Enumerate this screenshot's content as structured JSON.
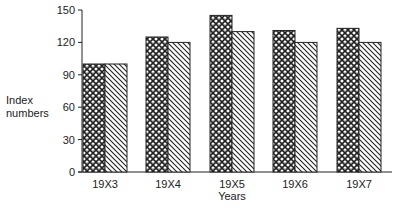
{
  "chart_data": {
    "type": "bar",
    "title": "",
    "xlabel": "Years",
    "ylabel": "Index numbers",
    "categories": [
      "19X3",
      "19X4",
      "19X5",
      "19X6",
      "19X7"
    ],
    "series": [
      {
        "name": "Series A (cross-hatched)",
        "pattern": "crosshatch",
        "values": [
          100,
          125,
          145,
          131,
          133
        ]
      },
      {
        "name": "Series B (diagonal-hatched)",
        "pattern": "diagonal",
        "values": [
          100,
          120,
          130,
          120,
          120
        ]
      }
    ],
    "yticks": [
      0,
      30,
      60,
      90,
      120,
      150
    ],
    "ylim": [
      0,
      150
    ],
    "grid": false,
    "legend": "none"
  },
  "labels": {
    "ylabel_line1": "Index",
    "ylabel_line2": "numbers",
    "xlabel": "Years"
  },
  "colors": {
    "ink": "#222222",
    "background": "#ffffff"
  }
}
